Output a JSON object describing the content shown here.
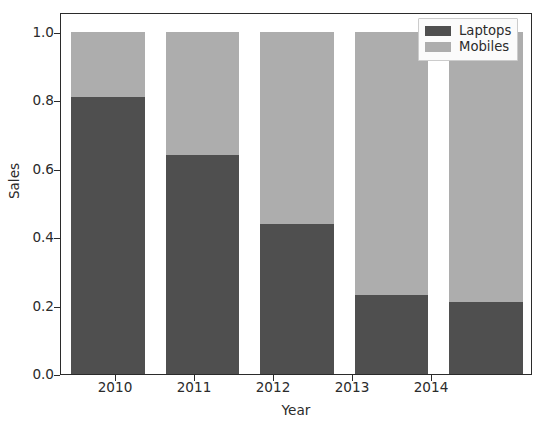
{
  "chart_data": {
    "type": "bar",
    "subtype": "stacked-bar-normalized",
    "title": "",
    "subtitle": "",
    "xlabel": "Year",
    "ylabel": "Sales",
    "categories": [
      "2010",
      "2011",
      "2012",
      "2013",
      "2014"
    ],
    "x": [
      2010,
      2011,
      2012,
      2013,
      2014
    ],
    "series": [
      {
        "name": "Laptops",
        "color": "#4f4f4f",
        "values": [
          0.81,
          0.64,
          0.44,
          0.23,
          0.21
        ]
      },
      {
        "name": "Mobiles",
        "color": "#adadad",
        "values": [
          0.19,
          0.36,
          0.56,
          0.77,
          0.79
        ]
      }
    ],
    "stack_totals": [
      1.0,
      1.0,
      1.0,
      1.0,
      1.0
    ],
    "ylim": [
      0.0,
      1.0
    ],
    "xlim_categories": 5,
    "yticks": [
      0.0,
      0.2,
      0.4,
      0.6,
      0.8,
      1.0
    ],
    "ytick_labels": [
      "0.0",
      "0.2",
      "0.4",
      "0.6",
      "0.8",
      "1.0"
    ],
    "xtick_labels": [
      "2010",
      "2011",
      "2012",
      "2013",
      "2014"
    ],
    "grid": false,
    "legend_position": "upper right",
    "legend_entries": [
      {
        "label": "Laptops",
        "color": "#4f4f4f"
      },
      {
        "label": "Mobiles",
        "color": "#adadad"
      }
    ],
    "bar_width_fraction": 0.78,
    "background_color": "#ffffff",
    "axes_edge_color": "#2b2b2b",
    "text_color": "#2b2b2b"
  },
  "axes": {
    "ylabel": "Sales",
    "xlabel": "Year",
    "ytick_labels": [
      "1.0",
      "0.8",
      "0.6",
      "0.4",
      "0.2",
      "0.0"
    ],
    "xtick_labels": [
      "2010",
      "2011",
      "2012",
      "2013",
      "2014"
    ]
  },
  "legend": {
    "items": [
      {
        "label": "Laptops"
      },
      {
        "label": "Mobiles"
      }
    ]
  }
}
